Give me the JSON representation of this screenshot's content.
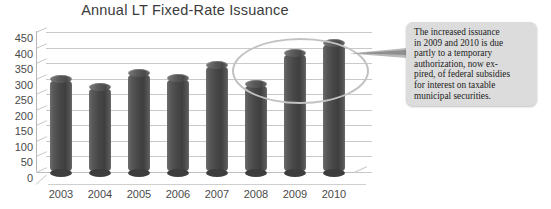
{
  "chart_data": {
    "type": "bar",
    "title": "Annual LT Fixed-Rate Issuance",
    "xlabel": "",
    "ylabel": "",
    "categories": [
      "2003",
      "2004",
      "2005",
      "2006",
      "2007",
      "2008",
      "2009",
      "2010"
    ],
    "values": [
      303,
      276,
      320,
      305,
      347,
      287,
      387,
      418
    ],
    "ylim": [
      0,
      450
    ],
    "yticks": [
      450,
      400,
      350,
      300,
      250,
      200,
      150,
      100,
      50,
      0
    ],
    "grid": true,
    "legend": "none",
    "series": [
      {
        "name": "Annual LT Fixed-Rate Issuance",
        "values": [
          303,
          276,
          320,
          305,
          347,
          287,
          387,
          418
        ]
      }
    ],
    "annotations": [
      {
        "type": "ellipse",
        "label": "highlight-ellipse-2009-2010",
        "covers": [
          "2009",
          "2010"
        ]
      },
      {
        "type": "callout",
        "text": "The increased issuance\nin 2009 and 2010 is due\npartly to a temporary\nauthorization, now ex-\npired, of federal subsidies\nfor interest on taxable\nmunicipal securities."
      }
    ]
  },
  "colors": {
    "bar": "#4a4a4a",
    "grid": "#c9c9c9",
    "title_text": "#3b3b3b",
    "tick_text": "#4a4a4a",
    "callout_bg": "#dcdcdc",
    "callout_text": "#1d1d1d",
    "ellipse_stroke": "#c2c2c2",
    "background": "#ffffff"
  }
}
